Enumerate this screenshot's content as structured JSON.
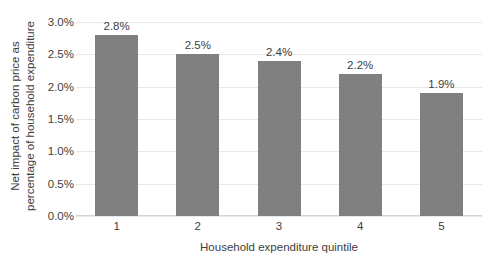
{
  "chart_data": {
    "type": "bar",
    "title": "",
    "subtitle": "",
    "categories": [
      "1",
      "2",
      "3",
      "4",
      "5"
    ],
    "values": [
      2.8,
      2.5,
      2.4,
      2.2,
      1.9
    ],
    "data_labels": [
      "2.8%",
      "2.5%",
      "2.4%",
      "2.2%",
      "1.9%"
    ],
    "xlabel": "Household expenditure quintile",
    "ylabel": "Net impact of carbon price as percentage of household expenditure",
    "ylabel_line1": "Net impact of carbon price as",
    "ylabel_line2": "percentage of household expenditure",
    "ylim": [
      0.0,
      3.0
    ],
    "ytick_values": [
      3.0,
      2.5,
      2.0,
      1.5,
      1.0,
      0.5,
      0.0
    ],
    "ytick_labels": [
      "3.0%",
      "2.5%",
      "2.0%",
      "1.5%",
      "1.0%",
      "0.5%",
      "0.0%"
    ],
    "grid": true,
    "legend": false,
    "legend_position": "none",
    "series": [
      {
        "name": "Net impact of carbon price",
        "values": [
          2.8,
          2.5,
          2.4,
          2.2,
          1.9
        ]
      }
    ],
    "colors": {
      "bar": "#808080",
      "gridline": "#e8e8e8",
      "axis": "#d4d4d4",
      "text": "#404040",
      "background": "#ffffff"
    }
  }
}
